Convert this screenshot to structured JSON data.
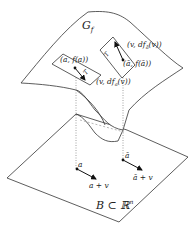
{
  "diagram": {
    "surface_label": "G",
    "surface_sub": "f",
    "base_label": "B ⊂ ℝ",
    "base_sup": "n",
    "tangent_planes": [
      {
        "name": "T",
        "point_label": "(a, f(a))",
        "vector_label": "(v, df",
        "vector_sub": "a",
        "vector_tail": "(v))"
      },
      {
        "name": "T",
        "point_label": "(ā, f(ā))",
        "vector_label": "(v, df",
        "vector_sub": "ā",
        "vector_tail": "(v))"
      }
    ],
    "base_points": [
      {
        "point": "a",
        "target": "a + v"
      },
      {
        "point": "ā",
        "target": "ā + v"
      }
    ],
    "colors": {
      "stroke": "#333333",
      "background": "#ffffff"
    }
  }
}
